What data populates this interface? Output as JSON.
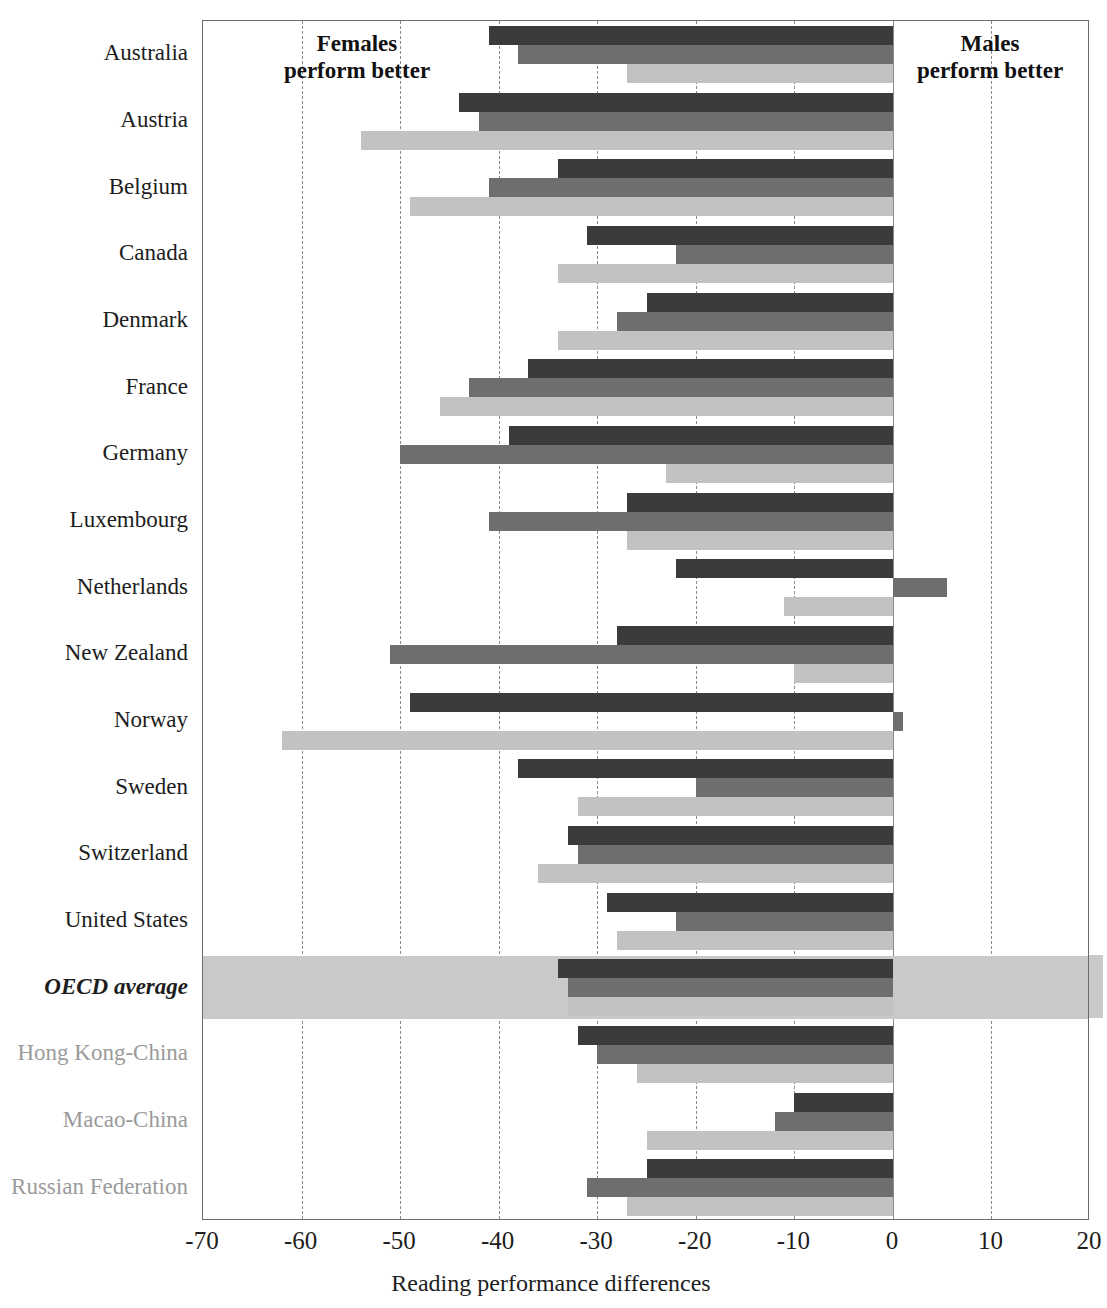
{
  "chart_data": {
    "type": "bar",
    "orientation": "horizontal-grouped",
    "title": "",
    "xlabel": "Reading performance differences",
    "ylabel": "",
    "xlim": [
      -70,
      20
    ],
    "xticks": [
      -70,
      -60,
      -50,
      -40,
      -30,
      -20,
      -10,
      0,
      10,
      20
    ],
    "xtick_labels": [
      "-70",
      "-60",
      "-50",
      "-40",
      "-30",
      "-20",
      "-10",
      "0",
      "10",
      "20"
    ],
    "grid": "vertical-dashed",
    "legend": "none",
    "annotations": [
      {
        "name": "females-better",
        "text": "Females\nperform better",
        "line1": "Females",
        "line2": "perform better"
      },
      {
        "name": "males-better",
        "text": "Males\nperform better",
        "line1": "Males",
        "line2": "perform better"
      }
    ],
    "series": [
      {
        "name": "series-1",
        "color": "#3b3b3b"
      },
      {
        "name": "series-2",
        "color": "#6e6e6e"
      },
      {
        "name": "series-3",
        "color": "#c2c2c2"
      }
    ],
    "categories": [
      "Australia",
      "Austria",
      "Belgium",
      "Canada",
      "Denmark",
      "France",
      "Germany",
      "Luxembourg",
      "Netherlands",
      "New Zealand",
      "Norway",
      "Sweden",
      "Switzerland",
      "United States",
      "OECD average",
      "Hong Kong-China",
      "Macao-China",
      "Russian Federation"
    ],
    "rows": [
      {
        "label": "Australia",
        "kind": "country",
        "values": [
          -41,
          -38,
          -27
        ]
      },
      {
        "label": "Austria",
        "kind": "country",
        "values": [
          -44,
          -42,
          -54
        ]
      },
      {
        "label": "Belgium",
        "kind": "country",
        "values": [
          -34,
          -41,
          -49
        ]
      },
      {
        "label": "Canada",
        "kind": "country",
        "values": [
          -31,
          -22,
          -34
        ]
      },
      {
        "label": "Denmark",
        "kind": "country",
        "values": [
          -25,
          -28,
          -34
        ]
      },
      {
        "label": "France",
        "kind": "country",
        "values": [
          -37,
          -43,
          -46
        ]
      },
      {
        "label": "Germany",
        "kind": "country",
        "values": [
          -39,
          -50,
          -23
        ]
      },
      {
        "label": "Luxembourg",
        "kind": "country",
        "values": [
          -27,
          -41,
          -27
        ]
      },
      {
        "label": "Netherlands",
        "kind": "country",
        "values": [
          -22,
          5.5,
          -11
        ]
      },
      {
        "label": "New Zealand",
        "kind": "country",
        "values": [
          -28,
          -51,
          -10
        ]
      },
      {
        "label": "Norway",
        "kind": "country",
        "values": [
          -49,
          1,
          -62
        ]
      },
      {
        "label": "Sweden",
        "kind": "country",
        "values": [
          -38,
          -20,
          -32
        ]
      },
      {
        "label": "Switzerland",
        "kind": "country",
        "values": [
          -33,
          -32,
          -36
        ]
      },
      {
        "label": "United States",
        "kind": "country",
        "values": [
          -29,
          -22,
          -28
        ]
      },
      {
        "label": "OECD average",
        "kind": "oecd",
        "values": [
          -34,
          -33,
          -33
        ]
      },
      {
        "label": "Hong Kong-China",
        "kind": "partner",
        "values": [
          -32,
          -30,
          -26
        ]
      },
      {
        "label": "Macao-China",
        "kind": "partner",
        "values": [
          -10,
          -12,
          -25
        ]
      },
      {
        "label": "Russian Federation",
        "kind": "partner",
        "values": [
          -25,
          -31,
          -27
        ]
      }
    ]
  }
}
